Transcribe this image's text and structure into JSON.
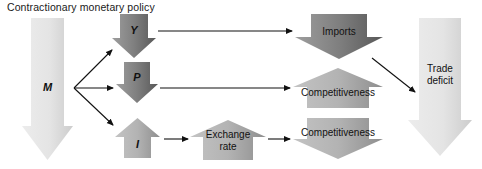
{
  "diagram": {
    "title": "Contractionary monetary policy",
    "type": "flow-diagram",
    "canvas": {
      "width": 482,
      "height": 169,
      "background": "#ffffff"
    },
    "palette": {
      "pale_gray_light": "#e9e9e9",
      "pale_gray_dark": "#cfcfcf",
      "mid_gray_light": "#bdbdbd",
      "mid_gray_dark": "#8f8f8f",
      "dark_gray_light": "#9a9a9a",
      "dark_gray_dark": "#5a5a5a",
      "connector": "#111111",
      "text": "#111111"
    },
    "nodes": [
      {
        "id": "money-supply",
        "label": "M",
        "label_style": "italic",
        "shape": "arrow-down",
        "tone": "pale",
        "meaning": "money supply falls",
        "x": 22,
        "y": 18,
        "w": 51,
        "h": 142,
        "head_h": 34,
        "shaft_inset": 9,
        "label_x": 22,
        "label_y": 82,
        "label_w": 51
      },
      {
        "id": "output",
        "label": "Y",
        "label_style": "italic",
        "shape": "arrow-down",
        "tone": "dark",
        "meaning": "output falls",
        "x": 112,
        "y": 14,
        "w": 44,
        "h": 44,
        "head_h": 20,
        "shaft_inset": 8,
        "label_x": 112,
        "label_y": 25,
        "label_w": 44
      },
      {
        "id": "price-level",
        "label": "P",
        "label_style": "italic",
        "shape": "arrow-down",
        "tone": "dark",
        "meaning": "price level falls",
        "x": 116,
        "y": 62,
        "w": 42,
        "h": 41,
        "head_h": 19,
        "shaft_inset": 8,
        "label_x": 116,
        "label_y": 72,
        "label_w": 42
      },
      {
        "id": "interest-rate",
        "label": "I",
        "label_style": "italic",
        "shape": "arrow-up",
        "tone": "mid",
        "meaning": "interest rate rises",
        "x": 115,
        "y": 118,
        "w": 45,
        "h": 40,
        "head_h": 19,
        "shaft_inset": 9,
        "label_x": 115,
        "label_y": 139,
        "label_w": 45
      },
      {
        "id": "exchange-rate",
        "label": "Exchange\nrate",
        "label_style": "plain",
        "shape": "arrow-up",
        "tone": "mid",
        "meaning": "exchange rate rises",
        "x": 190,
        "y": 120,
        "w": 76,
        "h": 40,
        "head_h": 17,
        "shaft_inset": 13,
        "label_x": 190,
        "label_y": 129,
        "label_w": 76
      },
      {
        "id": "imports",
        "label": "Imports",
        "label_style": "plain",
        "shape": "arrow-down",
        "tone": "dark",
        "meaning": "imports fall",
        "x": 295,
        "y": 14,
        "w": 88,
        "h": 45,
        "head_h": 22,
        "shaft_inset": 16,
        "label_x": 295,
        "label_y": 26,
        "label_w": 88
      },
      {
        "id": "competitiveness-price",
        "label": "Competitiveness",
        "label_style": "plain",
        "shape": "arrow-up",
        "tone": "mid",
        "meaning": "competitiveness rises via lower prices",
        "x": 293,
        "y": 68,
        "w": 90,
        "h": 40,
        "head_h": 19,
        "shaft_inset": 14,
        "label_x": 290,
        "label_y": 87,
        "label_w": 96
      },
      {
        "id": "competitiveness-exchange",
        "label": "Competitiveness",
        "label_style": "plain",
        "shape": "arrow-down",
        "tone": "mid",
        "meaning": "competitiveness falls via stronger currency",
        "x": 293,
        "y": 118,
        "w": 90,
        "h": 41,
        "head_h": 20,
        "shaft_inset": 14,
        "label_x": 290,
        "label_y": 127,
        "label_w": 96
      },
      {
        "id": "trade-deficit",
        "label": "Trade\ndeficit",
        "label_style": "plain",
        "shape": "arrow-down",
        "tone": "pale",
        "meaning": "trade deficit falls",
        "x": 408,
        "y": 18,
        "w": 64,
        "h": 138,
        "head_h": 36,
        "shaft_inset": 11,
        "label_x": 408,
        "label_y": 63,
        "label_w": 64
      }
    ],
    "connectors": [
      {
        "id": "m-to-y",
        "from": "money-supply",
        "to": "output",
        "x1": 74,
        "y1": 88,
        "x2": 112,
        "y2": 50
      },
      {
        "id": "m-to-p",
        "from": "money-supply",
        "to": "price-level",
        "x1": 74,
        "y1": 88,
        "x2": 113,
        "y2": 88
      },
      {
        "id": "m-to-i",
        "from": "money-supply",
        "to": "interest-rate",
        "x1": 74,
        "y1": 88,
        "x2": 113,
        "y2": 125
      },
      {
        "id": "y-to-imports",
        "from": "output",
        "to": "imports",
        "x1": 158,
        "y1": 31,
        "x2": 292,
        "y2": 31
      },
      {
        "id": "p-to-competitiveness",
        "from": "price-level",
        "to": "competitiveness-price",
        "x1": 160,
        "y1": 88,
        "x2": 290,
        "y2": 88
      },
      {
        "id": "i-to-exchange-rate",
        "from": "interest-rate",
        "to": "exchange-rate",
        "x1": 164,
        "y1": 139,
        "x2": 188,
        "y2": 139
      },
      {
        "id": "exchange-rate-to-competitiveness",
        "from": "exchange-rate",
        "to": "competitiveness-exchange",
        "x1": 268,
        "y1": 139,
        "x2": 290,
        "y2": 139
      },
      {
        "id": "imports-to-trade-deficit",
        "from": "imports",
        "to": "trade-deficit",
        "x1": 372,
        "y1": 58,
        "x2": 415,
        "y2": 92
      }
    ]
  }
}
